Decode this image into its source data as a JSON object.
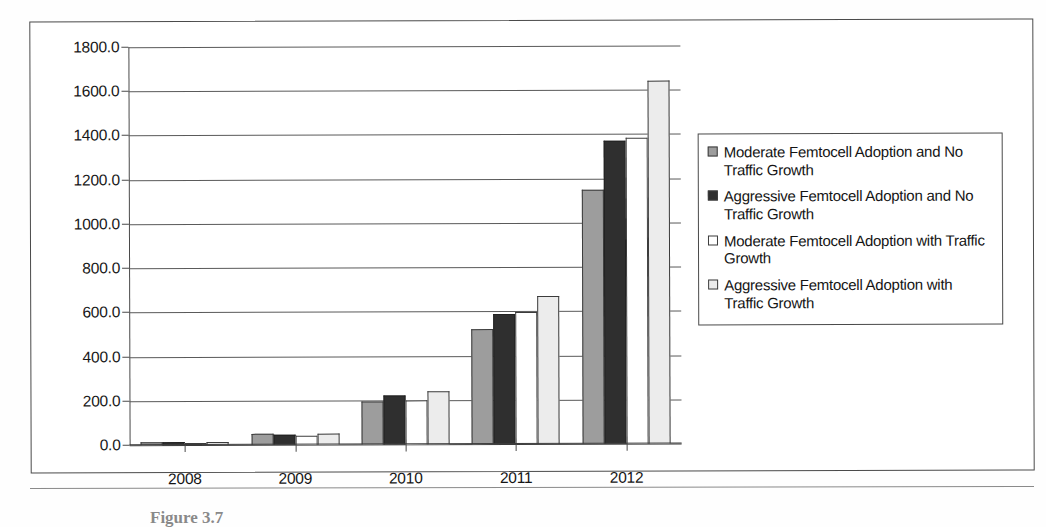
{
  "chart_data": {
    "type": "bar",
    "title": "",
    "xlabel": "",
    "ylabel": "",
    "categories": [
      "2008",
      "2009",
      "2010",
      "2011",
      "2012"
    ],
    "ylim": [
      0,
      1800
    ],
    "ytick_step": 200,
    "ytick_labels": [
      "1800.0",
      "1600.0",
      "1400.0",
      "1200.0",
      "1000.0",
      "800.0",
      "600.0",
      "400.0",
      "200.0",
      "0.0"
    ],
    "ytick_values": [
      1800,
      1600,
      1400,
      1200,
      1000,
      800,
      600,
      400,
      200,
      0
    ],
    "grid": true,
    "legend_position": "right",
    "series": [
      {
        "name": "Moderate Femtocell Adoption and No Traffic Growth",
        "color": "#9d9d9d",
        "values": [
          12,
          48,
          195,
          520,
          1150
        ]
      },
      {
        "name": "Aggressive Femtocell Adoption and No Traffic Growth",
        "color": "#2f2f2f",
        "values": [
          12,
          45,
          220,
          590,
          1370
        ]
      },
      {
        "name": "Moderate Femtocell Adoption with Traffic Growth",
        "color": "#ffffff",
        "values": [
          10,
          42,
          200,
          595,
          1385
        ]
      },
      {
        "name": "Aggressive Femtocell Adoption with Traffic Growth",
        "color": "#ececec",
        "values": [
          12,
          50,
          240,
          670,
          1640
        ]
      }
    ]
  },
  "caption": {
    "text": "Figure 3.7"
  }
}
